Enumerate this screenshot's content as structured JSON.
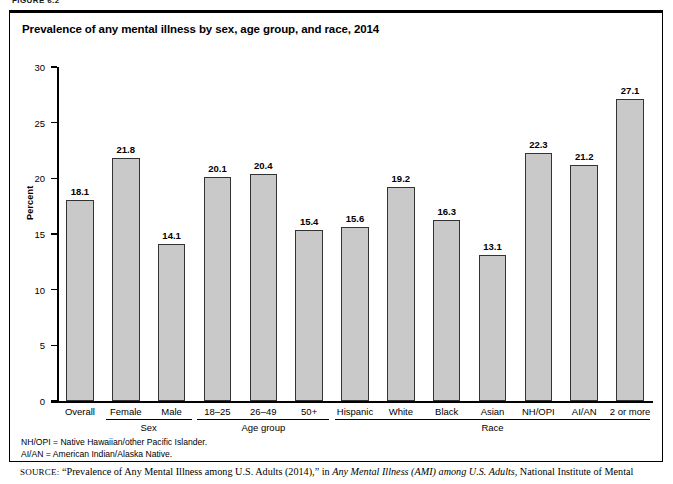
{
  "figure": {
    "label": "FIGURE 6.2",
    "title": "Prevalence of any mental illness by sex, age group, and race, 2014"
  },
  "chart_data": {
    "type": "bar",
    "title": "Prevalence of any mental illness by sex, age group, and race, 2014",
    "xlabel": "",
    "ylabel": "Percent",
    "ylim": [
      0,
      30
    ],
    "yticks": [
      0,
      5,
      10,
      15,
      20,
      25,
      30
    ],
    "grid": false,
    "legend": "none",
    "bar_color": "#c9c9c9",
    "bar_border_color": "#333333",
    "categories": [
      "Overall",
      "Female",
      "Male",
      "18–25",
      "26–49",
      "50+",
      "Hispanic",
      "White",
      "Black",
      "Asian",
      "NH/OPI",
      "AI/AN",
      "2 or more"
    ],
    "values": [
      18.1,
      21.8,
      14.1,
      20.1,
      20.4,
      15.4,
      15.6,
      19.2,
      16.3,
      13.1,
      22.3,
      21.2,
      27.1
    ],
    "value_labels": [
      "18.1",
      "21.8",
      "14.1",
      "20.1",
      "20.4",
      "15.4",
      "15.6",
      "19.2",
      "16.3",
      "13.1",
      "22.3",
      "21.2",
      "27.1"
    ],
    "groups": [
      {
        "label": "",
        "start": 0,
        "end": 0
      },
      {
        "label": "Sex",
        "start": 1,
        "end": 2
      },
      {
        "label": "Age group",
        "start": 3,
        "end": 5
      },
      {
        "label": "Race",
        "start": 6,
        "end": 12
      }
    ]
  },
  "footnotes": [
    "NH/OPI = Native Hawaiian/other Pacific Islander.",
    "AI/AN = American Indian/Alaska Native."
  ],
  "source": {
    "prefix": "SOURCE:",
    "text_1": " “Prevalence of Any Mental Illness among U.S. Adults (2014),” in ",
    "italic": "Any Mental Illness (AMI) among U.S. Adults",
    "text_2": ", National Institute of Mental"
  }
}
